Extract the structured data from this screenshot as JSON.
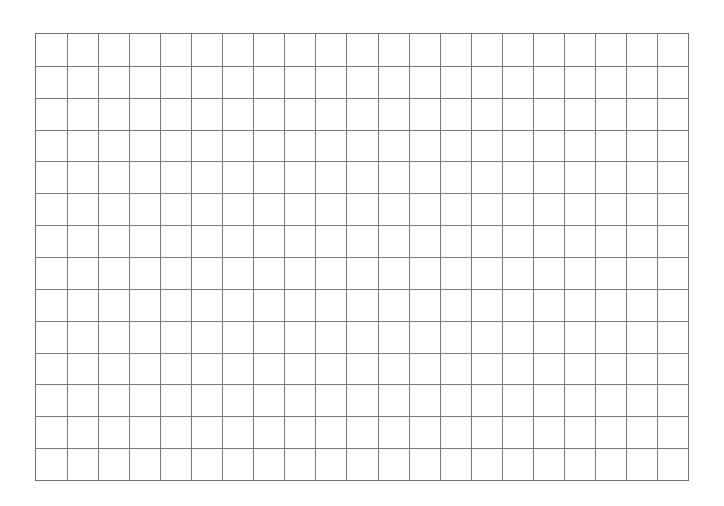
{
  "grid": {
    "columns": 21,
    "rows": 14,
    "line_color": "#7a7a7a",
    "background": "#ffffff"
  }
}
